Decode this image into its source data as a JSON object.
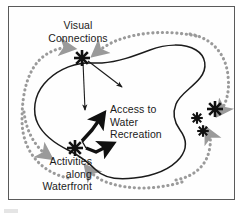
{
  "figure": {
    "type": "concept-diagram",
    "title": "",
    "frame": {
      "border_color": "#5a5a5a",
      "background": "#fefefe"
    },
    "colors": {
      "outline": "#1b1b1b",
      "dotted_path": "#9a9a9a",
      "marker": "#111111",
      "text": "#1b1b1b",
      "frame_border": "#5a5a5a"
    },
    "labels": [
      {
        "id": "visual-connections",
        "text": "Visual\nConnections",
        "align": "center"
      },
      {
        "id": "access-to-water-recreation",
        "text": "Access to\nWater\nRecreation",
        "align": "left"
      },
      {
        "id": "activities-along-waterfront",
        "text": "Activities\nalong\nWaterfront",
        "align": "right"
      }
    ],
    "markers": {
      "name": "asterisk-marker",
      "count": 5,
      "description": "eight-point star markers indicating key nodes",
      "points": [
        {
          "id": "marker-visual-connections",
          "x": 82,
          "y": 58,
          "size": "large"
        },
        {
          "id": "marker-activities-waterfront",
          "x": 75,
          "y": 148,
          "size": "large"
        },
        {
          "id": "marker-east-large",
          "x": 215,
          "y": 109,
          "size": "large"
        },
        {
          "id": "marker-east-mid",
          "x": 197,
          "y": 118,
          "size": "small"
        },
        {
          "id": "marker-east-low",
          "x": 203,
          "y": 131,
          "size": "small"
        }
      ]
    },
    "paths": {
      "shoreline": {
        "id": "waterbody-outline",
        "style": "solid",
        "color": "#1b1b1b",
        "description": "irregular closed blob representing the water body / site boundary"
      },
      "circulation": {
        "id": "dotted-circulation-loop",
        "style": "dotted",
        "color": "#9a9a9a",
        "description": "dotted loop with arrowheads encircling the water body indicating movement / circulation"
      }
    },
    "arrows": {
      "thin": [
        {
          "id": "view-arrow-down",
          "from": "marker-visual-connections",
          "direction": "down"
        },
        {
          "id": "view-arrow-southeast",
          "from": "marker-visual-connections",
          "direction": "southeast"
        }
      ],
      "thick": [
        {
          "id": "access-arrow-upper",
          "direction": "northeast"
        },
        {
          "id": "access-arrow-lower",
          "direction": "northeast"
        }
      ]
    }
  }
}
